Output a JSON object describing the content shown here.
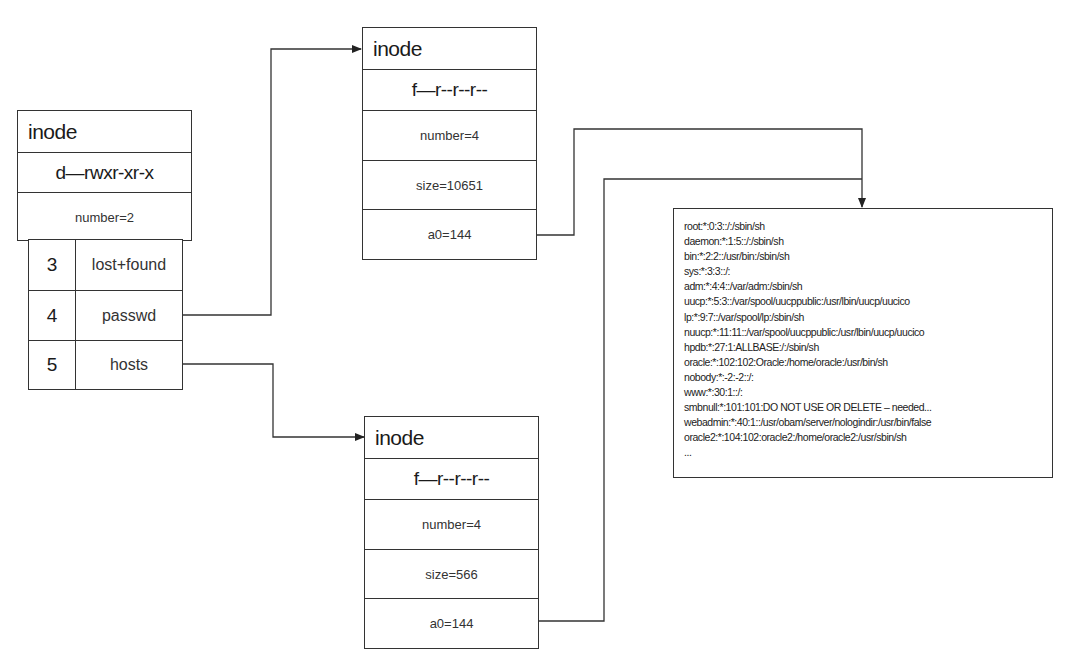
{
  "diagram": {
    "type": "unix-filesystem-inode-structure",
    "root_inode": {
      "title": "inode",
      "permissions": "d—rwxr-xr-x",
      "number": "number=2",
      "directory_entries": [
        {
          "inode": "3",
          "name": "lost+found"
        },
        {
          "inode": "4",
          "name": "passwd"
        },
        {
          "inode": "5",
          "name": "hosts"
        }
      ]
    },
    "passwd_inode": {
      "title": "inode",
      "permissions": "f—r--r--r--",
      "number": "number=4",
      "size": "size=10651",
      "a0": "a0=144"
    },
    "hosts_inode": {
      "title": "inode",
      "permissions": "f—r--r--r--",
      "number": "number=4",
      "size": "size=566",
      "a0": "a0=144"
    },
    "data_block": {
      "lines": [
        "root:*:0:3::/:/sbin/sh",
        "daemon:*:1:5::/:/sbin/sh",
        "bin:*:2:2::/usr/bin:/sbin/sh",
        "sys:*:3:3::/:",
        "adm:*:4:4::/var/adm:/sbin/sh",
        "uucp:*:5:3::/var/spool/uucppublic:/usr/lbin/uucp/uucico",
        "lp:*:9:7::/var/spool/lp:/sbin/sh",
        "nuucp:*:11:11::/var/spool/uucppublic:/usr/lbin/uucp/uucico",
        "hpdb:*:27:1:ALLBASE:/:/sbin/sh",
        "oracle:*:102:102:Oracle:/home/oracle:/usr/bin/sh",
        "nobody:*:-2:-2::/:",
        "www:*:30:1::/:",
        "smbnull:*:101:101:DO NOT USE OR DELETE – needed...",
        "webadmin:*:40:1::/usr/obam/server/nologindir:/usr/bin/false",
        "oracle2:*:104:102:oracle2:/home/oracle2:/usr/sbin/sh",
        "..."
      ]
    },
    "connections": [
      {
        "from": "root_inode.passwd",
        "to": "passwd_inode"
      },
      {
        "from": "root_inode.hosts",
        "to": "hosts_inode"
      },
      {
        "from": "passwd_inode.a0",
        "to": "data_block"
      },
      {
        "from": "hosts_inode.a0",
        "to": "data_block"
      }
    ],
    "colors": {
      "line": "#333333",
      "background": "#ffffff",
      "text": "#1a1a1a"
    }
  }
}
